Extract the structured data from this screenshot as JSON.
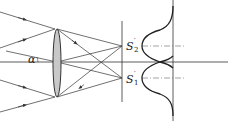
{
  "diagram": {
    "type": "lens-resolution-rayleigh",
    "colors": {
      "line": "#333333",
      "lens_fill": "#c8c8c8",
      "background": "#ffffff"
    },
    "labels": {
      "angle": "α",
      "image2_main": "S",
      "image2_prime": "′",
      "image2_sub": "2",
      "image1_main": "S",
      "image1_prime": "′",
      "image1_sub": "1"
    },
    "elements": {
      "optical_axis": "optical-axis",
      "lens": "converging-lens",
      "image_plane": "image-plane",
      "intensity_profile": "two-airy-peaks-intensity-curve"
    }
  }
}
